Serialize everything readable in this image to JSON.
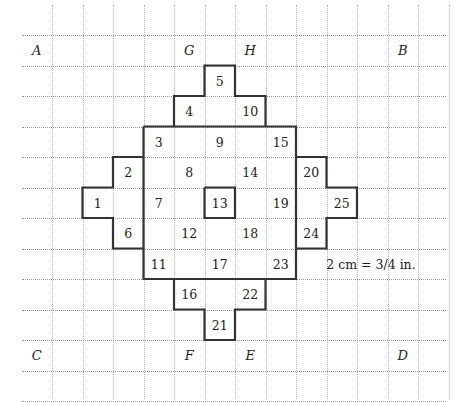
{
  "grid": {
    "x0": 52,
    "y0": 35,
    "cell": 30.5,
    "h_start": 22,
    "h_end": 446,
    "v_start": 5,
    "v_end": 399,
    "cols": 14,
    "rows": 13,
    "line_color": "#9a9a9a"
  },
  "corner_labels": [
    {
      "text": "A",
      "col": 0,
      "row": 1
    },
    {
      "text": "G",
      "col": 5,
      "row": 1
    },
    {
      "text": "H",
      "col": 7,
      "row": 1
    },
    {
      "text": "B",
      "col": 12,
      "row": 1
    },
    {
      "text": "C",
      "col": 0,
      "row": 11
    },
    {
      "text": "F",
      "col": 5,
      "row": 11
    },
    {
      "text": "E",
      "col": 7,
      "row": 11
    },
    {
      "text": "D",
      "col": 12,
      "row": 11
    }
  ],
  "pieces": [
    {
      "n": "1",
      "col": 2,
      "row": 6
    },
    {
      "n": "2",
      "col": 3,
      "row": 5
    },
    {
      "n": "3",
      "col": 4,
      "row": 4
    },
    {
      "n": "4",
      "col": 5,
      "row": 3
    },
    {
      "n": "5",
      "col": 6,
      "row": 2
    },
    {
      "n": "6",
      "col": 3,
      "row": 7
    },
    {
      "n": "7",
      "col": 4,
      "row": 6
    },
    {
      "n": "8",
      "col": 5,
      "row": 5
    },
    {
      "n": "9",
      "col": 6,
      "row": 4
    },
    {
      "n": "10",
      "col": 7,
      "row": 3
    },
    {
      "n": "11",
      "col": 4,
      "row": 8
    },
    {
      "n": "12",
      "col": 5,
      "row": 7
    },
    {
      "n": "13",
      "col": 6,
      "row": 6
    },
    {
      "n": "14",
      "col": 7,
      "row": 5
    },
    {
      "n": "15",
      "col": 8,
      "row": 4
    },
    {
      "n": "16",
      "col": 5,
      "row": 9
    },
    {
      "n": "17",
      "col": 6,
      "row": 8
    },
    {
      "n": "18",
      "col": 7,
      "row": 7
    },
    {
      "n": "19",
      "col": 8,
      "row": 6
    },
    {
      "n": "20",
      "col": 9,
      "row": 5
    },
    {
      "n": "21",
      "col": 6,
      "row": 10
    },
    {
      "n": "22",
      "col": 7,
      "row": 9
    },
    {
      "n": "23",
      "col": 8,
      "row": 8
    },
    {
      "n": "24",
      "col": 9,
      "row": 7
    },
    {
      "n": "25",
      "col": 10,
      "row": 6
    }
  ],
  "scale_note": {
    "text": "2 cm = 3/4 in.",
    "x": 371,
    "y": 264
  },
  "outline_color": "#333333"
}
